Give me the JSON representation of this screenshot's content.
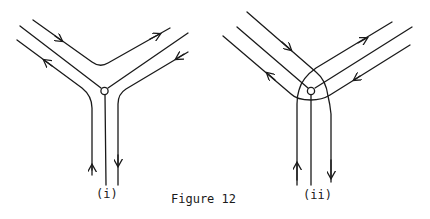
{
  "figure": {
    "caption": "Figure 12",
    "panels": [
      {
        "id": "i",
        "label": "(i)",
        "description": "Three channels meeting at a node; paths pass around the node without crossing"
      },
      {
        "id": "ii",
        "label": "(ii)",
        "description": "Three channels meeting at a node; paths loop around the node crossing each other"
      }
    ],
    "colors": {
      "ink": "#1a1a1a",
      "background": "#ffffff"
    }
  }
}
